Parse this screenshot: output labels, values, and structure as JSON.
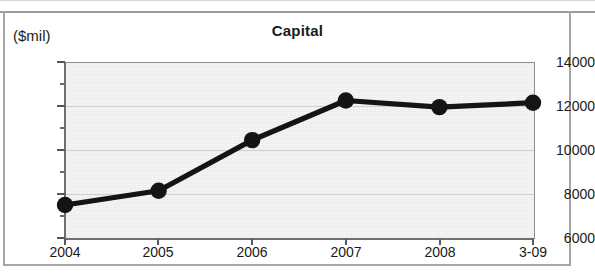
{
  "chart_data": {
    "type": "line",
    "title": "Capital",
    "ylabel": "($mil)",
    "xlabel": "",
    "categories": [
      "2004",
      "2005",
      "2006",
      "2007",
      "2008",
      "3-09"
    ],
    "values": [
      7500,
      8150,
      10450,
      12250,
      11950,
      12150
    ],
    "series": [
      {
        "name": "Capital",
        "values": [
          7500,
          8150,
          10450,
          12250,
          11950,
          12150
        ]
      }
    ],
    "ylim": [
      6000,
      14000
    ],
    "y_ticks": [
      "6000",
      "8000",
      "10000",
      "12000",
      "14000"
    ],
    "y_tick_values": [
      6000,
      8000,
      10000,
      12000,
      14000
    ],
    "y_minor_tick_values": [
      7000,
      9000,
      11000,
      13000
    ],
    "grid": true,
    "legend": false,
    "legend_position": "none",
    "marker": "filled-circle",
    "line_color": "#141414",
    "marker_color": "#141414",
    "plot_background": "#e9e9e9"
  },
  "colors": {
    "plot_bg": "#e9e9e9",
    "line": "#141414",
    "text": "#1a1a1a",
    "axis": "#6f6f6f",
    "grid": "#d2d2d2",
    "page_frame": "#a8a8a8"
  }
}
